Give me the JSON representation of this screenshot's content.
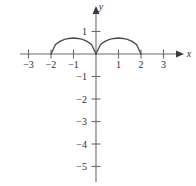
{
  "figure": {
    "background_color": "#ffffff",
    "width": 196,
    "height": 186,
    "axis_color": "#6b6b6b",
    "curve_color": "#4a4a4a",
    "text_color": "#2b2b2b"
  },
  "labels": {
    "x_axis_name": "x",
    "y_axis_name": "y"
  },
  "chart_data": {
    "type": "line",
    "title": "",
    "xlabel": "x",
    "ylabel": "y",
    "xlim": [
      -3.4,
      3.6
    ],
    "ylim": [
      -5.6,
      1.6
    ],
    "grid": false,
    "legend": "none",
    "x_ticks": [
      -3,
      -2,
      -1,
      1,
      2,
      3
    ],
    "x_tick_labels": [
      "−3",
      "−2",
      "−1",
      "1",
      "2",
      "3"
    ],
    "y_ticks": [
      1,
      -1,
      -2,
      -3,
      -4,
      -5
    ],
    "y_tick_labels": [
      "1",
      "−1",
      "−2",
      "−3",
      "−4",
      "−5"
    ],
    "series": [
      {
        "name": "left-arc",
        "x": [
          -2.0,
          -1.8,
          -1.6,
          -1.4,
          -1.2,
          -1.0,
          -0.8,
          -0.6,
          -0.4,
          -0.2,
          0.0
        ],
        "y": [
          0.0,
          0.42,
          0.56,
          0.65,
          0.69,
          0.71,
          0.69,
          0.65,
          0.56,
          0.42,
          0.0
        ]
      },
      {
        "name": "right-arc",
        "x": [
          0.0,
          0.2,
          0.4,
          0.6,
          0.8,
          1.0,
          1.2,
          1.4,
          1.6,
          1.8,
          2.0
        ],
        "y": [
          0.0,
          0.42,
          0.56,
          0.65,
          0.69,
          0.71,
          0.69,
          0.65,
          0.56,
          0.42,
          0.0
        ]
      }
    ],
    "x_intercepts": [
      -2,
      0,
      2
    ],
    "maxima": [
      {
        "x": -1,
        "y": 0.71
      },
      {
        "x": 1,
        "y": 0.71
      }
    ]
  }
}
